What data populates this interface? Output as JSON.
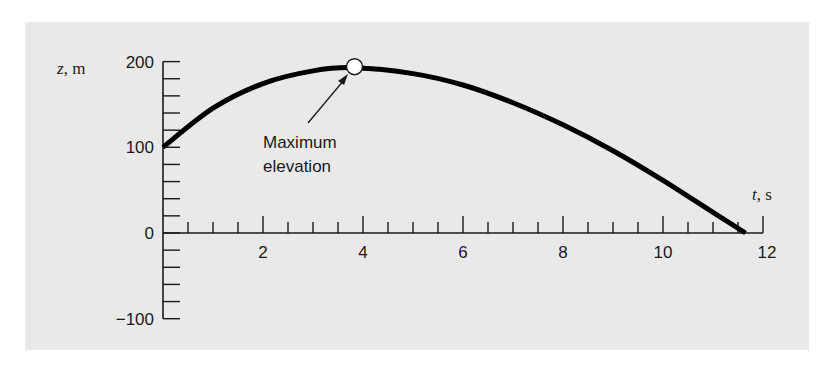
{
  "chart_data": {
    "type": "line",
    "title": "",
    "xlabel": "t, s",
    "ylabel": "z, m",
    "xlim": [
      0,
      12
    ],
    "ylim": [
      -100,
      200
    ],
    "x_ticks": [
      2,
      4,
      6,
      8,
      10,
      12
    ],
    "x_tick_labels": [
      "2",
      "4",
      "6",
      "8",
      "10",
      "12"
    ],
    "y_ticks": [
      -100,
      0,
      100,
      200
    ],
    "y_tick_labels": [
      "−100",
      "0",
      "100",
      "200"
    ],
    "grid": false,
    "legend": null,
    "series": [
      {
        "name": "z(t)",
        "x": [
          0,
          1,
          2,
          3,
          3.83,
          5,
          6,
          7,
          8,
          9,
          10,
          11,
          11.65
        ],
        "values": [
          100,
          145.6,
          174.4,
          189.2,
          192.9,
          186.0,
          172.7,
          152.0,
          126.2,
          96.0,
          61.4,
          24.0,
          0
        ]
      }
    ],
    "annotations": [
      {
        "text": "Maximum elevation",
        "x": 3.83,
        "y": 192.9,
        "marker": "open-circle",
        "arrow": true
      }
    ]
  },
  "labels": {
    "y_axis": "z, m",
    "x_axis": "t, s",
    "annotation_line1": "Maximum",
    "annotation_line2": "elevation"
  },
  "colors": {
    "background": "#e9e9e9",
    "curve": "#000000",
    "axis": "#1a1a1a"
  }
}
